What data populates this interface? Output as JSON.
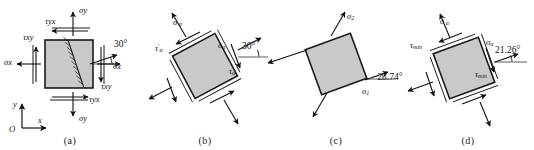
{
  "figure": {
    "background_color": "#ffffff",
    "element_fill_color": "#c9c9c9",
    "element_stroke_color": "#1b1b1b",
    "arrow_color": "#111111",
    "text_color": "#111111"
  },
  "panels": [
    {
      "id": "a",
      "caption": "(a)",
      "description": "Original stress element aligned with x-y axes showing an inclined section plane at 30 degrees",
      "angle_label": "30°",
      "axes": {
        "y_label": "y",
        "x_label": "x",
        "origin_label": "O"
      },
      "labels": {
        "sigma_y_top": "σy",
        "sigma_y_bottom": "σy",
        "sigma_x_left": "σx",
        "sigma_x_right": "σx",
        "tau_yx_top": "τyx",
        "tau_yx_bottom": "τyx",
        "tau_xy_left": "τxy",
        "tau_xy_right": "τxy"
      }
    },
    {
      "id": "b",
      "caption": "(b)",
      "description": "Element rotated by 30 degrees showing sigma alpha, tau alpha and their primed counterparts",
      "angle_label": "30°",
      "labels": {
        "sigma_alpha_prime": "σ'α",
        "tau_alpha_prime": "τ'α",
        "sigma_alpha": "σα",
        "tau_alpha": "τα"
      }
    },
    {
      "id": "c",
      "caption": "(c)",
      "description": "Principal stress element with principal stresses sigma 1 and sigma 2 at minus 23.74 degrees",
      "angle_label": "−23.74°",
      "labels": {
        "sigma_2": "σ2",
        "sigma_1": "σ1"
      }
    },
    {
      "id": "d",
      "caption": "(d)",
      "description": "Maximum shear stress element at 21.26 degrees showing tau min on two faces",
      "angle_label": "21.26°",
      "labels": {
        "sigma_alpha_prime": "σ'α",
        "sigma_alpha": "σα",
        "tau_min_upper": "τmin",
        "tau_min_lower": "τmin"
      }
    }
  ]
}
